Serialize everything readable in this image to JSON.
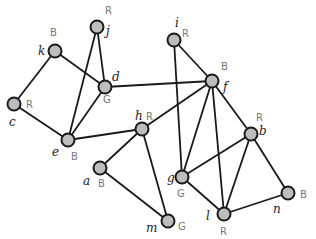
{
  "graph": {
    "nodes": [
      {
        "id": "j",
        "x": 97,
        "y": 27,
        "color": "R",
        "lx": 106,
        "ly": 35,
        "cx": 105,
        "cy": 14
      },
      {
        "id": "k",
        "x": 55,
        "y": 51,
        "color": "B",
        "lx": 38,
        "ly": 55,
        "cx": 50,
        "cy": 36
      },
      {
        "id": "d",
        "x": 105,
        "y": 87,
        "color": "G",
        "lx": 112,
        "ly": 81,
        "cx": 103,
        "cy": 103
      },
      {
        "id": "c",
        "x": 14,
        "y": 104,
        "color": "R",
        "lx": 9,
        "ly": 126,
        "cx": 26,
        "cy": 108
      },
      {
        "id": "e",
        "x": 68,
        "y": 140,
        "color": "B",
        "lx": 52,
        "ly": 156,
        "cx": 71,
        "cy": 160
      },
      {
        "id": "h",
        "x": 142,
        "y": 129,
        "color": "R",
        "lx": 135,
        "ly": 120,
        "cx": 146,
        "cy": 120
      },
      {
        "id": "a",
        "x": 100,
        "y": 168,
        "color": "B",
        "lx": 83,
        "ly": 185,
        "cx": 98,
        "cy": 187
      },
      {
        "id": "m",
        "x": 168,
        "y": 221,
        "color": "G",
        "lx": 146,
        "ly": 232,
        "cx": 178,
        "cy": 230
      },
      {
        "id": "i",
        "x": 174,
        "y": 40,
        "color": "R",
        "lx": 175,
        "ly": 27,
        "cx": 182,
        "cy": 37
      },
      {
        "id": "f",
        "x": 212,
        "y": 81,
        "color": "B",
        "lx": 223,
        "ly": 91,
        "cx": 221,
        "cy": 70
      },
      {
        "id": "b",
        "x": 251,
        "y": 134,
        "color": "R",
        "lx": 259,
        "ly": 135,
        "cx": 256,
        "cy": 121
      },
      {
        "id": "g",
        "x": 182,
        "y": 177,
        "color": "G",
        "lx": 167,
        "ly": 182,
        "cx": 177,
        "cy": 197
      },
      {
        "id": "n",
        "x": 288,
        "y": 193,
        "color": "B",
        "lx": 273,
        "ly": 213,
        "cx": 300,
        "cy": 198
      },
      {
        "id": "l",
        "x": 224,
        "y": 214,
        "color": "R",
        "lx": 206,
        "ly": 220,
        "cx": 220,
        "cy": 235
      }
    ],
    "edges": [
      [
        "k",
        "d"
      ],
      [
        "k",
        "c"
      ],
      [
        "j",
        "d"
      ],
      [
        "j",
        "e"
      ],
      [
        "d",
        "e"
      ],
      [
        "c",
        "e"
      ],
      [
        "e",
        "h"
      ],
      [
        "h",
        "a"
      ],
      [
        "h",
        "m"
      ],
      [
        "a",
        "m"
      ],
      [
        "d",
        "f"
      ],
      [
        "h",
        "f"
      ],
      [
        "i",
        "f"
      ],
      [
        "i",
        "g"
      ],
      [
        "f",
        "g"
      ],
      [
        "f",
        "l"
      ],
      [
        "f",
        "b"
      ],
      [
        "g",
        "b"
      ],
      [
        "g",
        "l"
      ],
      [
        "b",
        "l"
      ],
      [
        "b",
        "n"
      ],
      [
        "n",
        "l"
      ]
    ]
  }
}
